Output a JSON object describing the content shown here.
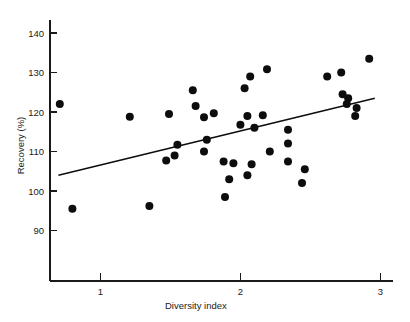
{
  "chart_data": {
    "type": "scatter",
    "title": "",
    "xlabel": "Diversity index",
    "ylabel": "Recovery (%)",
    "xlim": [
      0.6,
      3.05
    ],
    "ylim": [
      84,
      144
    ],
    "xticks": [
      1,
      2,
      3
    ],
    "xticklabels": [
      "1",
      "2",
      "3"
    ],
    "yticks": [
      90,
      100,
      110,
      120,
      130,
      140
    ],
    "yticklabels": [
      "90",
      "100",
      "110",
      "120",
      "130",
      "140"
    ],
    "grid": false,
    "legend": null,
    "marker": "filled-circle",
    "marker_color": "#0d0d0d",
    "marker_size_px": 8,
    "points": [
      {
        "x": 0.71,
        "y": 122.0
      },
      {
        "x": 0.8,
        "y": 95.5
      },
      {
        "x": 1.21,
        "y": 118.8
      },
      {
        "x": 1.35,
        "y": 96.2
      },
      {
        "x": 1.47,
        "y": 107.7
      },
      {
        "x": 1.49,
        "y": 119.5
      },
      {
        "x": 1.53,
        "y": 109.0
      },
      {
        "x": 1.55,
        "y": 111.7
      },
      {
        "x": 1.66,
        "y": 125.5
      },
      {
        "x": 1.68,
        "y": 121.5
      },
      {
        "x": 1.74,
        "y": 118.7
      },
      {
        "x": 1.74,
        "y": 110.0
      },
      {
        "x": 1.76,
        "y": 113.0
      },
      {
        "x": 1.81,
        "y": 119.7
      },
      {
        "x": 1.88,
        "y": 107.5
      },
      {
        "x": 1.89,
        "y": 98.5
      },
      {
        "x": 1.92,
        "y": 103.0
      },
      {
        "x": 1.95,
        "y": 107.0
      },
      {
        "x": 2.0,
        "y": 116.8
      },
      {
        "x": 2.03,
        "y": 126.0
      },
      {
        "x": 2.05,
        "y": 119.0
      },
      {
        "x": 2.05,
        "y": 104.0
      },
      {
        "x": 2.07,
        "y": 129.0
      },
      {
        "x": 2.08,
        "y": 106.8
      },
      {
        "x": 2.1,
        "y": 116.0
      },
      {
        "x": 2.16,
        "y": 119.2
      },
      {
        "x": 2.19,
        "y": 130.8
      },
      {
        "x": 2.21,
        "y": 110.0
      },
      {
        "x": 2.34,
        "y": 115.5
      },
      {
        "x": 2.34,
        "y": 112.0
      },
      {
        "x": 2.34,
        "y": 107.5
      },
      {
        "x": 2.44,
        "y": 102.0
      },
      {
        "x": 2.46,
        "y": 105.5
      },
      {
        "x": 2.62,
        "y": 129.0
      },
      {
        "x": 2.72,
        "y": 130.0
      },
      {
        "x": 2.73,
        "y": 124.5
      },
      {
        "x": 2.76,
        "y": 122.0
      },
      {
        "x": 2.77,
        "y": 123.5
      },
      {
        "x": 2.82,
        "y": 119.0
      },
      {
        "x": 2.83,
        "y": 121.0
      },
      {
        "x": 2.92,
        "y": 133.5
      }
    ],
    "trendline": {
      "name": "linear-fit",
      "x_start": 0.7,
      "y_start": 104.0,
      "x_end": 2.96,
      "y_end": 123.5,
      "color": "#0d0d0d"
    }
  }
}
